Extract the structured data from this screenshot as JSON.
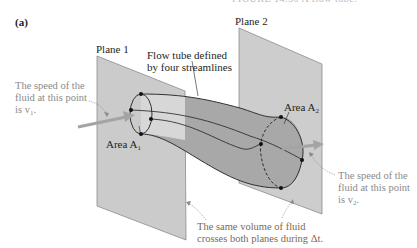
{
  "figure": {
    "caption_fragment": "FIGURE 14.30 A flow tube.",
    "panel_label": "(a)",
    "plane1_label": "Plane 1",
    "plane2_label": "Plane 2",
    "flow_tube_label_line1": "Flow tube defined",
    "flow_tube_label_line2": "by four streamlines",
    "area1_label": "Area A",
    "area1_sub": "1",
    "area2_label": "Area A",
    "area2_sub": "2",
    "speed1_line1": "The speed of the",
    "speed1_line2": "fluid at this point",
    "speed1_line3": "is v",
    "speed1_sub": "1",
    "speed2_line1": "The speed of the",
    "speed2_line2": "fluid at this point",
    "speed2_line3": "is v",
    "speed2_sub": "2",
    "volume_line1": "The same volume of fluid",
    "volume_line2": "crosses both planes during Δt."
  },
  "colors": {
    "plane_fill": "#c9c9c9",
    "tube_fill": "#a9a9a9",
    "arrow": "#a4a4a4",
    "line": "#231f20",
    "note_text": "#8a8a8a"
  }
}
